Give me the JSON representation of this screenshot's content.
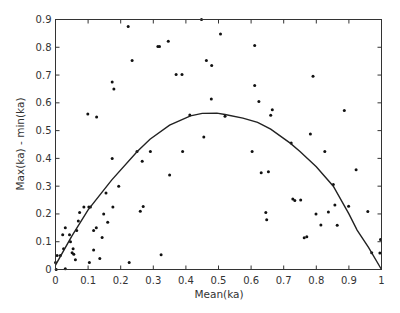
{
  "chart_data": {
    "type": "scatter",
    "title": "",
    "xlabel": "Mean(ka)",
    "ylabel": "Max(ka) - min(ka)",
    "xlim": [
      0,
      1
    ],
    "ylim": [
      0,
      0.9
    ],
    "grid": false,
    "legend": null,
    "x_ticks": [
      "0",
      "0.1",
      "0.2",
      "0.3",
      "0.4",
      "0.5",
      "0.6",
      "0.7",
      "0.8",
      "0.9",
      "1"
    ],
    "y_ticks": [
      "0",
      "0.1",
      "0.2",
      "0.3",
      "0.4",
      "0.5",
      "0.6",
      "0.7",
      "0.8",
      "0.9"
    ],
    "series": [
      {
        "name": "samples",
        "type": "scatter",
        "points": [
          [
            0.002,
            0.0
          ],
          [
            0.0,
            0.025
          ],
          [
            0.005,
            0.05
          ],
          [
            0.015,
            0.05
          ],
          [
            0.03,
            0.003
          ],
          [
            0.025,
            0.075
          ],
          [
            0.03,
            0.15
          ],
          [
            0.022,
            0.125
          ],
          [
            0.043,
            0.125
          ],
          [
            0.046,
            0.1
          ],
          [
            0.054,
            0.075
          ],
          [
            0.051,
            0.06
          ],
          [
            0.056,
            0.055
          ],
          [
            0.061,
            0.035
          ],
          [
            0.065,
            0.14
          ],
          [
            0.07,
            0.175
          ],
          [
            0.074,
            0.205
          ],
          [
            0.087,
            0.225
          ],
          [
            0.102,
            0.225
          ],
          [
            0.107,
            0.225
          ],
          [
            0.104,
            0.025
          ],
          [
            0.117,
            0.14
          ],
          [
            0.125,
            0.15
          ],
          [
            0.117,
            0.07
          ],
          [
            0.136,
            0.04
          ],
          [
            0.143,
            0.115
          ],
          [
            0.148,
            0.2
          ],
          [
            0.16,
            0.17
          ],
          [
            0.155,
            0.275
          ],
          [
            0.176,
            0.225
          ],
          [
            0.194,
            0.3
          ],
          [
            0.226,
            0.025
          ],
          [
            0.174,
            0.4
          ],
          [
            0.26,
            0.21
          ],
          [
            0.269,
            0.227
          ],
          [
            0.266,
            0.39
          ],
          [
            0.25,
            0.425
          ],
          [
            0.291,
            0.425
          ],
          [
            0.35,
            0.34
          ],
          [
            0.324,
            0.053
          ],
          [
            0.39,
            0.425
          ],
          [
            0.223,
            0.875
          ],
          [
            0.314,
            0.803
          ],
          [
            0.319,
            0.803
          ],
          [
            0.346,
            0.822
          ],
          [
            0.235,
            0.752
          ],
          [
            0.174,
            0.675
          ],
          [
            0.179,
            0.65
          ],
          [
            0.37,
            0.702
          ],
          [
            0.388,
            0.702
          ],
          [
            0.099,
            0.56
          ],
          [
            0.126,
            0.549
          ],
          [
            0.412,
            0.556
          ],
          [
            0.448,
            0.9
          ],
          [
            0.506,
            0.848
          ],
          [
            0.611,
            0.806
          ],
          [
            0.463,
            0.752
          ],
          [
            0.479,
            0.734
          ],
          [
            0.611,
            0.662
          ],
          [
            0.478,
            0.614
          ],
          [
            0.624,
            0.605
          ],
          [
            0.665,
            0.575
          ],
          [
            0.66,
            0.555
          ],
          [
            0.52,
            0.552
          ],
          [
            0.455,
            0.477
          ],
          [
            0.603,
            0.425
          ],
          [
            0.723,
            0.455
          ],
          [
            0.79,
            0.696
          ],
          [
            0.886,
            0.572
          ],
          [
            0.782,
            0.488
          ],
          [
            0.826,
            0.425
          ],
          [
            0.922,
            0.359
          ],
          [
            0.631,
            0.348
          ],
          [
            0.653,
            0.352
          ],
          [
            0.852,
            0.306
          ],
          [
            0.728,
            0.254
          ],
          [
            0.734,
            0.248
          ],
          [
            0.752,
            0.25
          ],
          [
            0.857,
            0.232
          ],
          [
            0.899,
            0.228
          ],
          [
            0.645,
            0.205
          ],
          [
            0.648,
            0.179
          ],
          [
            0.799,
            0.2
          ],
          [
            0.837,
            0.207
          ],
          [
            0.958,
            0.209
          ],
          [
            0.814,
            0.16
          ],
          [
            0.864,
            0.159
          ],
          [
            0.763,
            0.114
          ],
          [
            0.771,
            0.118
          ],
          [
            0.997,
            0.108
          ],
          [
            0.97,
            0.06
          ],
          [
            0.995,
            0.059
          ]
        ]
      },
      {
        "name": "fit",
        "type": "line",
        "points": [
          [
            0.0,
            0.016
          ],
          [
            0.05,
            0.12
          ],
          [
            0.1,
            0.215
          ],
          [
            0.172,
            0.322
          ],
          [
            0.25,
            0.424
          ],
          [
            0.29,
            0.469
          ],
          [
            0.35,
            0.52
          ],
          [
            0.414,
            0.553
          ],
          [
            0.45,
            0.562
          ],
          [
            0.495,
            0.563
          ],
          [
            0.52,
            0.558
          ],
          [
            0.575,
            0.545
          ],
          [
            0.62,
            0.53
          ],
          [
            0.66,
            0.505
          ],
          [
            0.72,
            0.455
          ],
          [
            0.75,
            0.425
          ],
          [
            0.8,
            0.37
          ],
          [
            0.852,
            0.3
          ],
          [
            0.9,
            0.2
          ],
          [
            0.925,
            0.142
          ],
          [
            0.96,
            0.08
          ],
          [
            1.0,
            0.0
          ]
        ]
      }
    ]
  }
}
